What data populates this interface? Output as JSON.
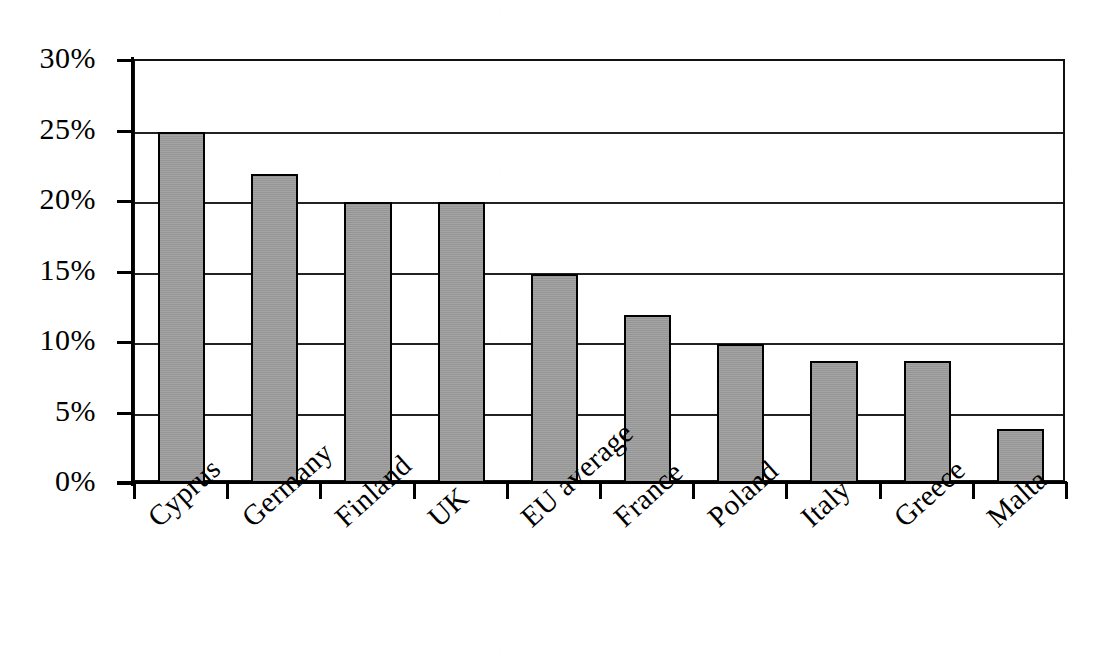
{
  "chart_data": {
    "type": "bar",
    "title": "",
    "subtitle": "",
    "xlabel": "",
    "ylabel": "",
    "categories": [
      "Cyprus",
      "Germany",
      "Finland",
      "UK",
      "EU average",
      "France",
      "Poland",
      "Italy",
      "Greece",
      "Malta"
    ],
    "values": [
      25,
      22,
      20,
      20,
      14.9,
      12,
      9.9,
      8.7,
      8.7,
      3.9
    ],
    "value_unit": "%",
    "ylim": [
      0,
      30
    ],
    "ytick_values": [
      0,
      5,
      10,
      15,
      20,
      25,
      30
    ],
    "ytick_labels": [
      "0%",
      "5%",
      "10%",
      "15%",
      "20%",
      "25%",
      "30%"
    ],
    "grid": true,
    "grid_axis": "y",
    "legend": false,
    "legend_position": "none",
    "bar_color": "#9a9a9a",
    "bar_edge_color": "#000000",
    "axis_color": "#000000",
    "background_color": "#ffffff",
    "xtick_label_rotation": -42
  },
  "axes": {
    "y_axis_name": "y-axis",
    "x_axis_name": "x-axis"
  }
}
